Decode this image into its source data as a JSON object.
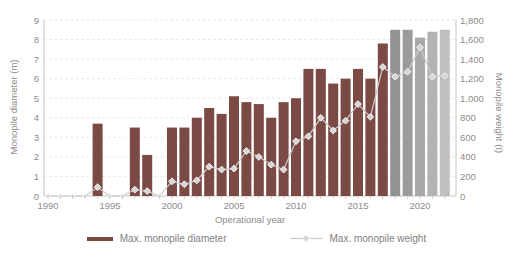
{
  "figure": {
    "legend_diameter": "Max. monopile diameter",
    "legend_weight": "Max. monopile weight"
  },
  "chart_data": {
    "type": "combo",
    "xlabel": "Operational year",
    "x": [
      1990,
      1991,
      1992,
      1993,
      1994,
      1995,
      1996,
      1997,
      1998,
      1999,
      2000,
      2001,
      2002,
      2003,
      2004,
      2005,
      2006,
      2007,
      2008,
      2009,
      2010,
      2011,
      2012,
      2013,
      2014,
      2015,
      2016,
      2017,
      2018,
      2019,
      2020,
      2021,
      2022
    ],
    "series": [
      {
        "name": "Max. monopile diameter",
        "type": "bar",
        "axis": "left",
        "values": [
          null,
          null,
          null,
          null,
          3.7,
          null,
          null,
          3.5,
          2.1,
          null,
          3.5,
          3.5,
          4.0,
          4.5,
          4.2,
          5.1,
          4.8,
          4.7,
          4.0,
          4.8,
          5.0,
          6.5,
          6.5,
          5.75,
          6.0,
          6.5,
          6.0,
          7.8,
          8.5,
          8.5,
          8.1,
          8.4,
          8.5
        ]
      },
      {
        "name": "Max. monopile weight",
        "type": "line",
        "axis": "right",
        "values": [
          0,
          0,
          0,
          0,
          90,
          0,
          0,
          65,
          50,
          0,
          150,
          120,
          160,
          300,
          270,
          280,
          460,
          400,
          320,
          270,
          560,
          610,
          800,
          670,
          770,
          940,
          810,
          1320,
          1220,
          1270,
          1520,
          1220,
          1230
        ]
      }
    ],
    "left_axis": {
      "label": "Monopile diameter (m)",
      "min": 0,
      "max": 9,
      "tick_labels": [
        "0",
        "1",
        "2",
        "3",
        "4",
        "5",
        "6",
        "7",
        "8",
        "9"
      ]
    },
    "right_axis": {
      "label": "Monopile weight (t)",
      "min": 0,
      "max": 1800,
      "tick_labels": [
        "0",
        "200",
        "400",
        "600",
        "800",
        "1,000",
        "1,200",
        "1,400",
        "1,600",
        "1,800"
      ]
    },
    "x_ticks": [
      "1990",
      "1995",
      "2000",
      "2005",
      "2010",
      "2015",
      "2020"
    ],
    "grid": "horizontal-dashed",
    "legend_position": "bottom",
    "colors": {
      "bar_default": "#7b4a44",
      "bar_overrides": {
        "2018": "#929292",
        "2019": "#9b9b9b",
        "2020": "#a8a8a8",
        "2021": "#b3b3b3",
        "2022": "#bfbfbf"
      },
      "line": "#cbcbcb",
      "marker_fill": "#d6d6d6",
      "marker_stroke": "#f2f2f2",
      "grid": "#e5e5e5",
      "axis": "#c4c4c4",
      "text": "#8c8c8c"
    }
  }
}
